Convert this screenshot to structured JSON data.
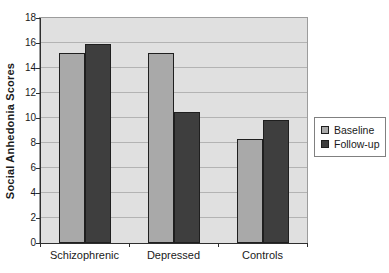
{
  "chart_data": {
    "type": "bar",
    "title": "",
    "xlabel": "",
    "ylabel": "Social Anhedonia Scores",
    "categories": [
      "Schizophrenic",
      "Depressed",
      "Controls"
    ],
    "series": [
      {
        "name": "Baseline",
        "values": [
          15.2,
          15.2,
          8.3
        ],
        "color": "#A9A9A9"
      },
      {
        "name": "Follow-up",
        "values": [
          15.9,
          10.5,
          9.8
        ],
        "color": "#3E3E3E"
      }
    ],
    "ylim": [
      0,
      18
    ],
    "ytick_step": 2,
    "y_ticks": [
      0,
      2,
      4,
      6,
      8,
      10,
      12,
      14,
      16,
      18
    ],
    "grid": true,
    "legend_position": "right",
    "style": {
      "plot_background": "#E0E0E0",
      "gridline_color": "#B3B3B3",
      "axis_color": "#2E2E2E",
      "bar_border_color": "#1F1F1F",
      "text_color": "#1A1A1A",
      "legend_border_color": "#808080"
    }
  }
}
